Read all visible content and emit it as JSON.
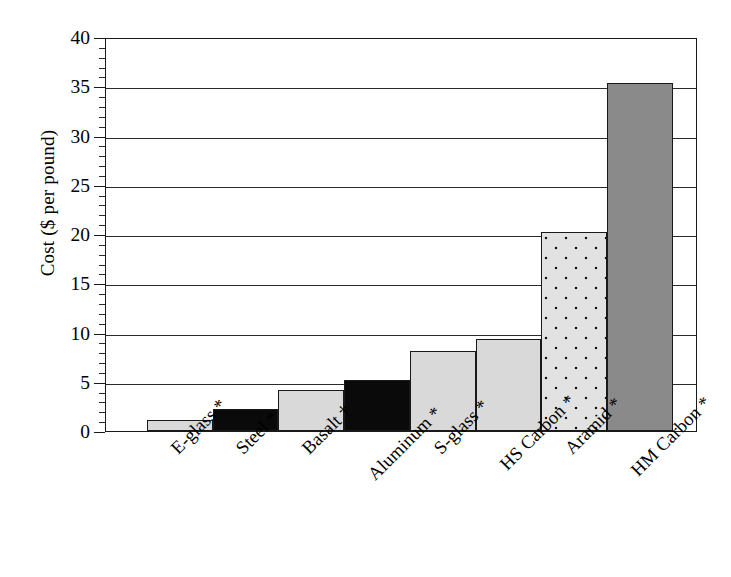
{
  "chart_data": {
    "type": "bar",
    "title": "",
    "xlabel": "",
    "ylabel": "Cost ($ per pound)",
    "ylim": [
      0,
      40
    ],
    "ytick_labels": [
      "0",
      "5",
      "10",
      "15",
      "20",
      "25",
      "30",
      "35",
      "40"
    ],
    "ytick_values": [
      0,
      5,
      10,
      15,
      20,
      25,
      30,
      35,
      40
    ],
    "minor_tick_step": 1,
    "grid": "horizontal",
    "legend": "none",
    "categories": [
      "E-glass *",
      "Steel *",
      "Basalt †",
      "Aluminum *",
      "S-glass *",
      "HS Carbon *",
      "Aramid *",
      "HM Carbon *"
    ],
    "values": [
      1.1,
      2.2,
      4.2,
      5.2,
      8.1,
      9.3,
      20.2,
      35.3
    ],
    "bar_styles": [
      "light-gray",
      "black",
      "light-gray",
      "black",
      "light-gray",
      "light-gray",
      "dotted-light-gray",
      "medium-gray"
    ],
    "colors": {
      "light_gray": "#d9d9d9",
      "black": "#0a0a0a",
      "medium_gray": "#8a8a8a",
      "dotted_background": "#e2e2e2",
      "dot": "#111111",
      "axis": "#1a1a1a",
      "gridline": "#2b2b2b",
      "plot_background": "#ffffff"
    }
  },
  "caption": {
    "text": ""
  }
}
